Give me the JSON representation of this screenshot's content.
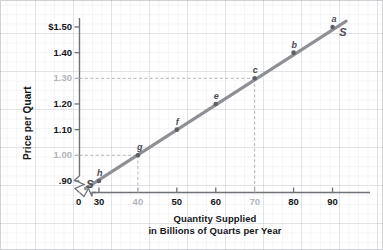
{
  "chart_data": {
    "type": "line",
    "title": "",
    "xlabel_lines": [
      "Quantity Supplied",
      "in Billions of Quarts per Year"
    ],
    "ylabel": "Price per Quart",
    "xlim": [
      25,
      95
    ],
    "ylim": [
      0.855,
      1.535
    ],
    "grid": true,
    "legend": "none",
    "axis_break": true,
    "series": [
      {
        "name": "S",
        "label": "S",
        "color": "#8e9095",
        "x": [
          30,
          40,
          50,
          60,
          70,
          80,
          90
        ],
        "y": [
          0.9,
          1.0,
          1.1,
          1.2,
          1.3,
          1.4,
          1.5
        ],
        "point_labels": [
          "h",
          "g",
          "f",
          "e",
          "c",
          "b",
          "a"
        ]
      }
    ],
    "xticks": [
      {
        "value": 0,
        "label": "0",
        "muted": false
      },
      {
        "value": 30,
        "label": "30",
        "muted": false
      },
      {
        "value": 40,
        "label": "40",
        "muted": true
      },
      {
        "value": 50,
        "label": "50",
        "muted": false
      },
      {
        "value": 60,
        "label": "60",
        "muted": false
      },
      {
        "value": 70,
        "label": "70",
        "muted": true
      },
      {
        "value": 80,
        "label": "80",
        "muted": false
      },
      {
        "value": 90,
        "label": "90",
        "muted": false
      }
    ],
    "yticks": [
      {
        "value": 1.5,
        "label": "$1.50",
        "muted": false
      },
      {
        "value": 1.4,
        "label": "1.40",
        "muted": false
      },
      {
        "value": 1.3,
        "label": "1.30",
        "muted": true
      },
      {
        "value": 1.2,
        "label": "1.20",
        "muted": false
      },
      {
        "value": 1.1,
        "label": "1.10",
        "muted": false
      },
      {
        "value": 1.0,
        "label": "1.00",
        "muted": true
      },
      {
        "value": 0.9,
        "label": ".90",
        "muted": false
      }
    ],
    "reference_lines": [
      {
        "from_label": "g",
        "x": 40,
        "y": 1.0,
        "style": "dashed"
      },
      {
        "from_label": "c",
        "x": 70,
        "y": 1.3,
        "style": "dashed"
      }
    ],
    "annotations": [
      {
        "name": "curve-label-top",
        "text": "S",
        "x": 92.5,
        "y": 1.475
      },
      {
        "name": "curve-label-bottom",
        "text": "S",
        "x": 27.5,
        "y": 0.885
      }
    ],
    "colors": {
      "line": "#8e9095",
      "point": "#5d6066",
      "axis": "#6e7176",
      "text": "#15161a",
      "muted_text": "#b2b4ba",
      "dash": "#a9abb0",
      "grid": "#c3c8d2"
    }
  }
}
